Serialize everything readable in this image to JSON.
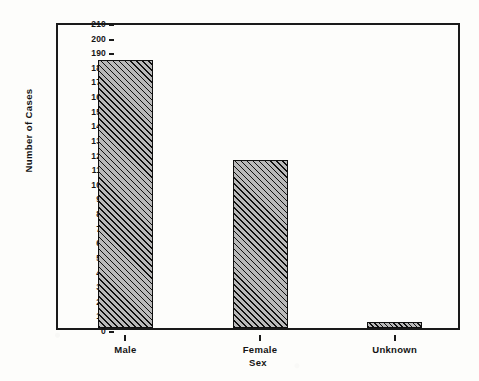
{
  "chart_data": {
    "type": "bar",
    "title": "",
    "subtitle": "",
    "xlabel": "Sex",
    "ylabel": "Number of Cases",
    "categories": [
      "Male",
      "Female",
      "Unknown"
    ],
    "values": [
      183,
      115,
      4
    ],
    "series": [
      {
        "name": "Number of Cases",
        "values": [
          183,
          115,
          4
        ]
      }
    ],
    "ylim": [
      0,
      210
    ],
    "xlim": [
      0,
      3
    ],
    "ytick_step": 10,
    "yticks": [
      0,
      10,
      20,
      30,
      40,
      50,
      60,
      70,
      80,
      90,
      100,
      110,
      120,
      130,
      140,
      150,
      160,
      170,
      180,
      190,
      200,
      210
    ],
    "ytick_labels": [
      "0",
      "10",
      "20",
      "30",
      "40",
      "50",
      "60",
      "70",
      "80",
      "90",
      "100",
      "110",
      "120",
      "130",
      "140",
      "150",
      "160",
      "170",
      "180",
      "190",
      "200",
      "210"
    ],
    "xtick_labels": [
      "Male",
      "Female",
      "Unknown"
    ],
    "grid": false,
    "legend": null,
    "legend_position": "none",
    "annotations": [],
    "bar_fill": "diagonal-hatch",
    "bar_fill_color": "#b9b9b9",
    "bar_edge_color": "#101010",
    "axis_color": "#1a1a1a",
    "background_color": "#fdfdfb",
    "frame": "box"
  }
}
